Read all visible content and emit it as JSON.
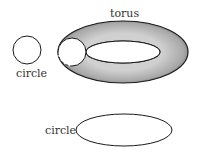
{
  "labels": {
    "torus": "torus",
    "circle_small": "circle",
    "circle_ellipse": "circle"
  },
  "colors": {
    "stroke": "#1a1a1a",
    "torus_fill_dark": "#6e6e6e",
    "torus_fill_light": "#c8c8c8",
    "background": "#ffffff"
  }
}
